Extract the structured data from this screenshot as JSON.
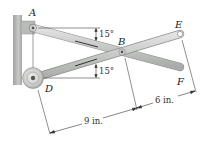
{
  "diagram": {
    "type": "mechanism",
    "points": {
      "A": {
        "label": "A"
      },
      "B": {
        "label": "B"
      },
      "D": {
        "label": "D"
      },
      "E": {
        "label": "E"
      },
      "F": {
        "label": "F"
      }
    },
    "angles": {
      "upper": "15°",
      "lower": "15°"
    },
    "dimensions": {
      "DB": "9 in.",
      "BE": "6 in."
    },
    "colors": {
      "rod_fill": "#c9cbc9",
      "rod_edge": "#8e908e",
      "wall": "#b4b6b4",
      "line": "#333333"
    }
  }
}
